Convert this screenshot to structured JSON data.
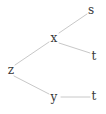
{
  "figure": {
    "type": "tree-diagram",
    "background_color": "#ffffff",
    "edge_color": "#c8c8c8",
    "node_text_color": "#3a3a3a",
    "width": 106,
    "height": 114
  },
  "chart_data": {
    "type": "diagram",
    "title": "",
    "layout": "tree",
    "nodes": [
      {
        "id": "n_s",
        "label": "s",
        "x": 91,
        "y": 10
      },
      {
        "id": "n_x",
        "label": "x",
        "x": 54,
        "y": 38
      },
      {
        "id": "n_t1",
        "label": "t",
        "x": 94,
        "y": 56
      },
      {
        "id": "n_z",
        "label": "z",
        "x": 11,
        "y": 70
      },
      {
        "id": "n_y",
        "label": "y",
        "x": 54,
        "y": 97
      },
      {
        "id": "n_t2",
        "label": "t",
        "x": 94,
        "y": 96
      }
    ],
    "edges": [
      {
        "from": "n_x",
        "to": "n_s",
        "x1": 59,
        "y1": 33,
        "x2": 87,
        "y2": 14
      },
      {
        "from": "n_x",
        "to": "n_t1",
        "x1": 59,
        "y1": 43,
        "x2": 90,
        "y2": 53
      },
      {
        "from": "n_z",
        "to": "n_x",
        "x1": 15,
        "y1": 65,
        "x2": 49,
        "y2": 42
      },
      {
        "from": "n_z",
        "to": "n_y",
        "x1": 14,
        "y1": 76,
        "x2": 49,
        "y2": 94
      },
      {
        "from": "n_y",
        "to": "n_t2",
        "x1": 61,
        "y1": 97,
        "x2": 90,
        "y2": 97
      }
    ]
  }
}
